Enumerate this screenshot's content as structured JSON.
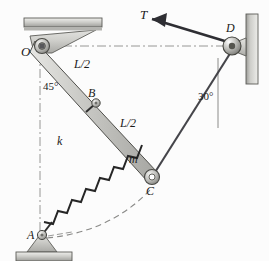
{
  "figure": {
    "background_color": "#fcfcfc",
    "member_fill": "#c8c8c4",
    "member_stroke": "#4a4a48",
    "support_fill": "#b9b9b5",
    "line_color": "#3a3a38",
    "dash_color": "#8a8a88"
  },
  "points": {
    "O": {
      "label": "O",
      "x": 40,
      "y": 46,
      "desc": "fixed pivot at ceiling bracket"
    },
    "B": {
      "label": "B",
      "x": 97,
      "y": 103,
      "desc": "spring attachment midpoint of bar"
    },
    "C": {
      "label": "C",
      "x": 152,
      "y": 177,
      "desc": "lower end of bar, cable connection"
    },
    "D": {
      "label": "D",
      "x": 232,
      "y": 46,
      "desc": "pulley on right wall"
    },
    "A": {
      "label": "A",
      "x": 42,
      "y": 237,
      "desc": "pin support on ground for spring"
    }
  },
  "labels": {
    "tension": "T",
    "upper_half": "L/2",
    "lower_half": "L/2",
    "spring_constant": "k",
    "mass": "m",
    "angle_at_O": "45°",
    "angle_at_D": "30°",
    "point_O": "O",
    "point_B": "B",
    "point_C": "C",
    "point_D": "D",
    "point_A": "A"
  },
  "elements": {
    "bar": {
      "name": "rigid-bar-OC",
      "from": "O",
      "to": "C",
      "length_label": "L"
    },
    "spring": {
      "name": "spring-AB",
      "from": "A",
      "to": "B",
      "coils": 11,
      "stiffness_label": "k"
    },
    "cable": {
      "name": "cable-CD",
      "from": "C",
      "to": "D",
      "tension_label": "T"
    },
    "arc": {
      "name": "motion-arc",
      "style": "dashed",
      "desc": "dashed arc showing path of C about O"
    },
    "centerline_horizontal": {
      "name": "centerline-OD",
      "style": "dash-dot"
    },
    "centerline_vertical_O": {
      "name": "centerline-vertical-O",
      "style": "dash-dot"
    },
    "centerline_vertical_D": {
      "name": "reference-vertical-D",
      "style": "solid-thin"
    },
    "ceiling": {
      "name": "ceiling-support",
      "hatched": true
    },
    "wall": {
      "name": "wall-support-right",
      "hatched": true
    },
    "ground": {
      "name": "ground-support-A",
      "hatched": true
    }
  }
}
